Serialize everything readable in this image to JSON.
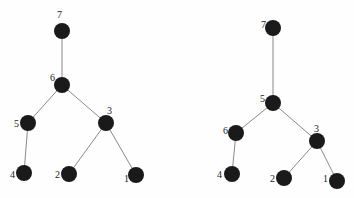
{
  "diagram": {
    "type": "tree-comparison",
    "trees": [
      {
        "name": "left-tree",
        "nodes": [
          {
            "id": "7",
            "label": "7",
            "x": 62,
            "y": 31,
            "lx": 57,
            "ly": 18
          },
          {
            "id": "6",
            "label": "6",
            "x": 62,
            "y": 85,
            "lx": 50,
            "ly": 81
          },
          {
            "id": "5",
            "label": "5",
            "x": 28,
            "y": 123,
            "lx": 14,
            "ly": 127
          },
          {
            "id": "3",
            "label": "3",
            "x": 106,
            "y": 123,
            "lx": 107,
            "ly": 114
          },
          {
            "id": "4",
            "label": "4",
            "x": 24,
            "y": 173,
            "lx": 10,
            "ly": 178
          },
          {
            "id": "2",
            "label": "2",
            "x": 69,
            "y": 174,
            "lx": 55,
            "ly": 178
          },
          {
            "id": "1",
            "label": "1",
            "x": 136,
            "y": 175,
            "lx": 124,
            "ly": 182
          }
        ],
        "edges": [
          [
            "7",
            "6"
          ],
          [
            "6",
            "5"
          ],
          [
            "6",
            "3"
          ],
          [
            "5",
            "4"
          ],
          [
            "3",
            "2"
          ],
          [
            "3",
            "1"
          ]
        ]
      },
      {
        "name": "right-tree",
        "nodes": [
          {
            "id": "7",
            "label": "7",
            "x": 273,
            "y": 28,
            "lx": 261,
            "ly": 28
          },
          {
            "id": "5",
            "label": "5",
            "x": 273,
            "y": 103,
            "lx": 260,
            "ly": 102
          },
          {
            "id": "6",
            "label": "6",
            "x": 236,
            "y": 133,
            "lx": 223,
            "ly": 134
          },
          {
            "id": "3",
            "label": "3",
            "x": 317,
            "y": 141,
            "lx": 314,
            "ly": 132
          },
          {
            "id": "4",
            "label": "4",
            "x": 232,
            "y": 174,
            "lx": 217,
            "ly": 178
          },
          {
            "id": "2",
            "label": "2",
            "x": 284,
            "y": 178,
            "lx": 270,
            "ly": 182
          },
          {
            "id": "1",
            "label": "1",
            "x": 337,
            "y": 181,
            "lx": 323,
            "ly": 182
          }
        ],
        "edges": [
          [
            "7",
            "5"
          ],
          [
            "5",
            "6"
          ],
          [
            "5",
            "3"
          ],
          [
            "6",
            "4"
          ],
          [
            "3",
            "2"
          ],
          [
            "3",
            "1"
          ]
        ]
      }
    ],
    "node_radius": 8,
    "colors": {
      "node": "#1a1a1a",
      "edge": "#8a8a8a",
      "label": "#222222"
    }
  }
}
